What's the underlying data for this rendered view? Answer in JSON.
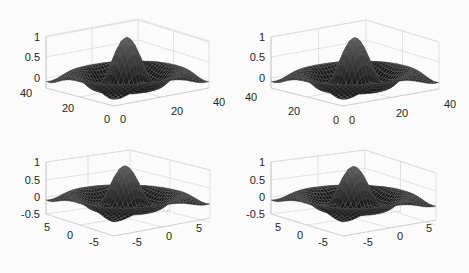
{
  "figure": {
    "background": "#fbfbfb",
    "text_color": "#262626",
    "grid_color": "#dcdcdc",
    "surface_color": "#1c1c1c",
    "mesh_color": "#6e6e6e"
  },
  "chart_data": [
    {
      "type": "surface",
      "title": "",
      "position": "top-left",
      "function": "sinc-like radial surface z = sin(r)/r",
      "xlabel": "",
      "ylabel": "",
      "zlabel": "",
      "x_ticks": [
        "0",
        "20",
        "40"
      ],
      "y_ticks": [
        "0",
        "20",
        "40"
      ],
      "z_ticks": [
        "0",
        "0.5",
        "1"
      ],
      "xlim": [
        0,
        40
      ],
      "ylim": [
        0,
        40
      ],
      "zlim": [
        -0.25,
        1
      ],
      "grid": true,
      "peak_value": 1,
      "geometry": {
        "back_top": [
          138,
          19
        ],
        "left_top": [
          46,
          36
        ],
        "right_top": [
          209,
          41
        ],
        "left_bottom": [
          46,
          88
        ],
        "front_bottom": [
          114,
          106
        ],
        "right_bottom": [
          209,
          88
        ],
        "peak": [
          126,
          42
        ],
        "base_level_y": 78,
        "z_tick_y": [
          78,
          57,
          37
        ],
        "left_axis_labels": [
          {
            "t": "40",
            "x": 20,
            "y": 97
          },
          {
            "t": "20",
            "x": 62,
            "y": 112
          },
          {
            "t": "0",
            "x": 104,
            "y": 123
          }
        ],
        "right_axis_labels": [
          {
            "t": "0",
            "x": 120,
            "y": 123
          },
          {
            "t": "20",
            "x": 171,
            "y": 115
          },
          {
            "t": "40",
            "x": 213,
            "y": 106
          }
        ],
        "z_label_x": 40
      }
    },
    {
      "type": "surface",
      "title": "",
      "position": "top-right",
      "function": "sinc-like radial surface z = sin(r)/r",
      "xlabel": "",
      "ylabel": "",
      "zlabel": "",
      "x_ticks": [
        "0",
        "20",
        "40"
      ],
      "y_ticks": [
        "0",
        "20",
        "40"
      ],
      "z_ticks": [
        "0",
        "0.5",
        "1"
      ],
      "xlim": [
        0,
        40
      ],
      "ylim": [
        0,
        40
      ],
      "zlim": [
        -0.25,
        1
      ],
      "grid": true,
      "peak_value": 1,
      "geometry": {
        "back_top": [
          366,
          20
        ],
        "left_top": [
          271,
          37
        ],
        "right_top": [
          439,
          42
        ],
        "left_bottom": [
          271,
          88
        ],
        "front_bottom": [
          343,
          106
        ],
        "right_bottom": [
          439,
          89
        ],
        "peak": [
          352,
          43
        ],
        "base_level_y": 78,
        "z_tick_y": [
          78,
          57,
          37
        ],
        "left_axis_labels": [
          {
            "t": "40",
            "x": 245,
            "y": 101
          },
          {
            "t": "20",
            "x": 288,
            "y": 115
          },
          {
            "t": "0",
            "x": 333,
            "y": 124
          }
        ],
        "right_axis_labels": [
          {
            "t": "0",
            "x": 349,
            "y": 124
          },
          {
            "t": "20",
            "x": 396,
            "y": 117
          },
          {
            "t": "40",
            "x": 444,
            "y": 108
          }
        ],
        "z_label_x": 265
      }
    },
    {
      "type": "surface",
      "title": "",
      "position": "bottom-left",
      "function": "sinc-like radial surface z = sin(r)/r",
      "xlabel": "",
      "ylabel": "",
      "zlabel": "",
      "x_ticks": [
        "-5",
        "0",
        "5"
      ],
      "y_ticks": [
        "-5",
        "0",
        "5"
      ],
      "z_ticks": [
        "-0.5",
        "0",
        "0.5",
        "1"
      ],
      "xlim": [
        -7.5,
        7.5
      ],
      "ylim": [
        -7.5,
        7.5
      ],
      "zlim": [
        -0.5,
        1
      ],
      "grid": true,
      "peak_value": 1,
      "geometry": {
        "back_top": [
          130,
          150
        ],
        "left_top": [
          46,
          162
        ],
        "right_top": [
          210,
          170
        ],
        "left_bottom": [
          46,
          214
        ],
        "front_bottom": [
          114,
          236
        ],
        "right_bottom": [
          210,
          218
        ],
        "peak": [
          125,
          166
        ],
        "base_level_y": 197,
        "z_tick_y": [
          214,
          197,
          180,
          162
        ],
        "left_axis_labels": [
          {
            "t": "5",
            "x": 44,
            "y": 231
          },
          {
            "t": "0",
            "x": 67,
            "y": 239
          },
          {
            "t": "-5",
            "x": 89,
            "y": 246
          }
        ],
        "right_axis_labels": [
          {
            "t": "-5",
            "x": 132,
            "y": 246
          },
          {
            "t": "0",
            "x": 166,
            "y": 240
          },
          {
            "t": "5",
            "x": 196,
            "y": 232
          }
        ],
        "z_label_x": 40
      }
    },
    {
      "type": "surface",
      "title": "",
      "position": "bottom-right",
      "function": "sinc-like radial surface z = sin(r)/r",
      "xlabel": "",
      "ylabel": "",
      "zlabel": "",
      "x_ticks": [
        "-5",
        "0",
        "5"
      ],
      "y_ticks": [
        "-5",
        "0",
        "5"
      ],
      "z_ticks": [
        "-0.5",
        "0",
        "0.5",
        "1"
      ],
      "xlim": [
        -7.5,
        7.5
      ],
      "ylim": [
        -7.5,
        7.5
      ],
      "zlim": [
        -0.5,
        1
      ],
      "grid": true,
      "peak_value": 1,
      "geometry": {
        "back_top": [
          365,
          150
        ],
        "left_top": [
          271,
          162
        ],
        "right_top": [
          436,
          173
        ],
        "left_bottom": [
          271,
          214
        ],
        "front_bottom": [
          343,
          236
        ],
        "right_bottom": [
          436,
          220
        ],
        "peak": [
          353,
          168
        ],
        "base_level_y": 197,
        "z_tick_y": [
          214,
          197,
          180,
          162
        ],
        "left_axis_labels": [
          {
            "t": "5",
            "x": 275,
            "y": 231
          },
          {
            "t": "0",
            "x": 297,
            "y": 239
          },
          {
            "t": "-5",
            "x": 318,
            "y": 246
          }
        ],
        "right_axis_labels": [
          {
            "t": "-5",
            "x": 363,
            "y": 246
          },
          {
            "t": "0",
            "x": 397,
            "y": 240
          },
          {
            "t": "5",
            "x": 426,
            "y": 232
          }
        ],
        "z_label_x": 265
      }
    }
  ]
}
